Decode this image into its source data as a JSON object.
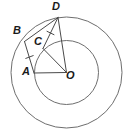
{
  "figure": {
    "background_color": "#ffffff",
    "width": 127,
    "height": 138
  },
  "geometry": {
    "center": {
      "x": 66.5,
      "y": 72.5
    },
    "circles": [
      {
        "name": "outer-circle",
        "cx": 66.5,
        "cy": 72.5,
        "r": 55.5,
        "color": "#6e6e6e"
      },
      {
        "name": "inner-circle",
        "cx": 66.5,
        "cy": 72.5,
        "r": 32.0,
        "color": "#6e6e6e"
      }
    ],
    "points": [
      {
        "label": "B",
        "x": 24.5,
        "y": 41.5,
        "label_x": 13,
        "label_y": 25
      },
      {
        "label": "D",
        "x": 58.0,
        "y": 17.5,
        "label_x": 52,
        "label_y": 1
      },
      {
        "label": "C",
        "x": 43.0,
        "y": 48.5,
        "label_x": 34,
        "label_y": 36
      },
      {
        "label": "A",
        "x": 34.0,
        "y": 73.0,
        "label_x": 22,
        "label_y": 66
      },
      {
        "label": "O",
        "x": 66.5,
        "y": 72.5,
        "label_x": 66,
        "label_y": 70
      }
    ],
    "segments": [
      {
        "name": "segment-BD",
        "from": "B",
        "to": "D"
      },
      {
        "name": "segment-BA",
        "from": "B",
        "to": "A"
      },
      {
        "name": "segment-AO",
        "from": "A",
        "to": "O"
      },
      {
        "name": "segment-CO",
        "from": "C",
        "to": "O"
      },
      {
        "name": "segment-DO",
        "from": "D",
        "to": "O"
      },
      {
        "name": "segment-DC",
        "from": "D",
        "to": "C"
      }
    ],
    "tick_marks": [
      {
        "name": "tick-on-BA",
        "x": 29.5,
        "y": 57.0
      },
      {
        "name": "tick-on-CD",
        "x": 50.5,
        "y": 33.0
      }
    ],
    "stroke_color": "#4a4a4a",
    "label_color": "#1a1a1a"
  },
  "labels": {
    "B": "B",
    "D": "D",
    "C": "C",
    "A": "A",
    "O": "O"
  }
}
